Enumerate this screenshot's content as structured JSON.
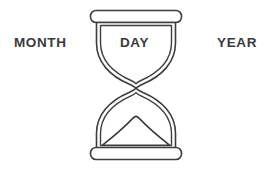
{
  "canvas": {
    "width": 269,
    "height": 170,
    "background_color": "#ffffff"
  },
  "figure": {
    "name": "hourglass",
    "stroke_color": "#3d3d42",
    "fill_color": "#ffffff",
    "stroke_width": 1.6
  },
  "labels": {
    "left": "MONTH",
    "center": "DAY",
    "right": "YEAR",
    "text_color": "#3a3a3c"
  }
}
